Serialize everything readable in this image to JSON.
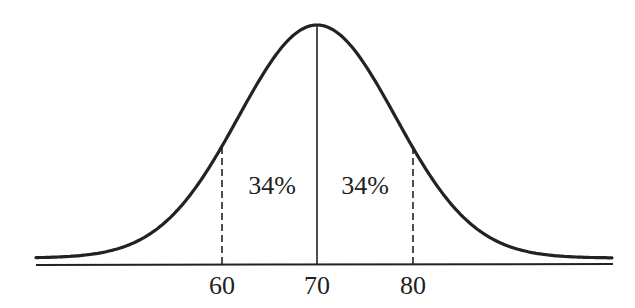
{
  "chart_data": {
    "type": "normal-distribution",
    "title": "",
    "mean": 70,
    "std_dev": 10,
    "x_ticks": [
      60,
      70,
      80
    ],
    "tick_labels": [
      "60",
      "70",
      "80"
    ],
    "regions": [
      {
        "from": 60,
        "to": 70,
        "label": "34%"
      },
      {
        "from": 70,
        "to": 80,
        "label": "34%"
      }
    ],
    "lines": [
      {
        "x": 60,
        "style": "dashed"
      },
      {
        "x": 70,
        "style": "solid"
      },
      {
        "x": 80,
        "style": "dashed"
      }
    ],
    "xlabel": "",
    "ylabel": "",
    "grid": false
  },
  "labels": {
    "tick_60": "60",
    "tick_70": "70",
    "tick_80": "80",
    "region_left": "34%",
    "region_right": "34%"
  },
  "colors": {
    "stroke": "#222222",
    "background": "#ffffff"
  }
}
